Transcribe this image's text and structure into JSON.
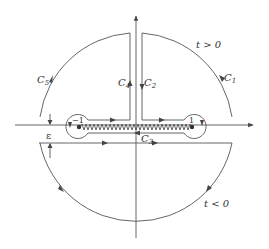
{
  "figure": {
    "type": "contour-integration-diagram",
    "labels": {
      "c1": "C",
      "c1_sub": "1",
      "c2": "C",
      "c2_sub": "2",
      "c3": "C",
      "c3_sub": "3",
      "c4": "C",
      "c4_sub": "4",
      "c5": "C",
      "c5_sub": "5",
      "t_pos": "t > 0",
      "t_neg": "t < 0",
      "epsilon": "ε",
      "left_branch_point": "−1",
      "right_branch_point": "1"
    },
    "colors": {
      "line": "#555555",
      "text": "#333333",
      "background": "#ffffff"
    }
  }
}
